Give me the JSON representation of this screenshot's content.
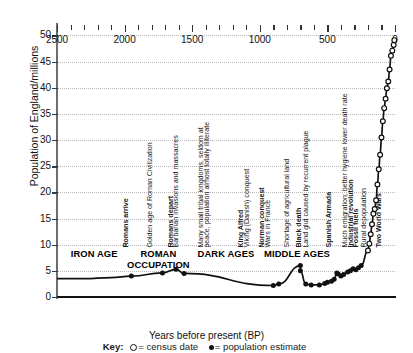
{
  "chart_data": {
    "type": "line",
    "title": "",
    "xlabel": "Years before present (BP)",
    "ylabel": "Population of England/millions",
    "xlim": [
      2500,
      0
    ],
    "ylim": [
      0,
      52
    ],
    "xticks": [
      2500,
      2000,
      1500,
      1000,
      500,
      0
    ],
    "yticks": [
      0,
      5,
      10,
      15,
      20,
      25,
      30,
      35,
      40,
      45,
      50
    ],
    "grid": "horizontal-dotted",
    "x_minor_tick_interval": 100,
    "legend_position": "below-axis",
    "series": [
      {
        "name": "population estimate",
        "marker": "filled-circle",
        "points": [
          {
            "bp": 1950,
            "pop": 4.0
          },
          {
            "bp": 1720,
            "pop": 4.6
          },
          {
            "bp": 1620,
            "pop": 5.3
          },
          {
            "bp": 1560,
            "pop": 4.5
          },
          {
            "bp": 900,
            "pop": 2.2
          },
          {
            "bp": 860,
            "pop": 2.5
          },
          {
            "bp": 700,
            "pop": 6.0
          },
          {
            "bp": 700,
            "pop": 5.0
          },
          {
            "bp": 660,
            "pop": 2.5
          },
          {
            "bp": 620,
            "pop": 2.3
          },
          {
            "bp": 560,
            "pop": 2.3
          },
          {
            "bp": 520,
            "pop": 2.6
          },
          {
            "bp": 500,
            "pop": 2.8
          },
          {
            "bp": 470,
            "pop": 3.0
          },
          {
            "bp": 450,
            "pop": 3.4
          },
          {
            "bp": 430,
            "pop": 4.6
          },
          {
            "bp": 420,
            "pop": 4.4
          },
          {
            "bp": 400,
            "pop": 4.0
          },
          {
            "bp": 380,
            "pop": 4.3
          },
          {
            "bp": 350,
            "pop": 4.8
          },
          {
            "bp": 330,
            "pop": 5.0
          },
          {
            "bp": 310,
            "pop": 5.4
          },
          {
            "bp": 290,
            "pop": 5.2
          },
          {
            "bp": 270,
            "pop": 5.6
          },
          {
            "bp": 250,
            "pop": 6.0
          }
        ]
      },
      {
        "name": "census date",
        "marker": "open-circle",
        "points": [
          {
            "bp": 200,
            "pop": 8.9
          },
          {
            "bp": 190,
            "pop": 10.2
          },
          {
            "bp": 180,
            "pop": 12.0
          },
          {
            "bp": 170,
            "pop": 13.9
          },
          {
            "bp": 160,
            "pop": 15.9
          },
          {
            "bp": 150,
            "pop": 16.8
          },
          {
            "bp": 140,
            "pop": 18.5
          },
          {
            "bp": 130,
            "pop": 21.5
          },
          {
            "bp": 120,
            "pop": 24.4
          },
          {
            "bp": 110,
            "pop": 27.2
          },
          {
            "bp": 100,
            "pop": 30.5
          },
          {
            "bp": 90,
            "pop": 33.6
          },
          {
            "bp": 80,
            "pop": 36.1
          },
          {
            "bp": 70,
            "pop": 37.9
          },
          {
            "bp": 60,
            "pop": 39.9
          },
          {
            "bp": 50,
            "pop": 41.2
          },
          {
            "bp": 40,
            "pop": 43.5
          },
          {
            "bp": 30,
            "pop": 46.1
          },
          {
            "bp": 20,
            "pop": 47.1
          },
          {
            "bp": 10,
            "pop": 48.2
          },
          {
            "bp": 5,
            "pop": 49.1
          }
        ]
      }
    ],
    "eras": [
      {
        "label": "IRON AGE",
        "bp_start": 2500,
        "bp_end": 1950,
        "lines": [
          "IRON AGE"
        ]
      },
      {
        "label": "ROMAN OCCUPATION",
        "bp_start": 1950,
        "bp_end": 1550,
        "lines": [
          "ROMAN",
          "OCCUPATION"
        ]
      },
      {
        "label": "DARK AGES",
        "bp_start": 1550,
        "bp_end": 950,
        "lines": [
          "DARK AGES"
        ]
      },
      {
        "label": "MIDDLE AGES",
        "bp_start": 950,
        "bp_end": 500,
        "lines": [
          "MIDDLE AGES"
        ]
      }
    ],
    "annotations": [
      {
        "text": "Romans arrive",
        "bp": 1955,
        "bold": true
      },
      {
        "text": "Golden age of Roman Civilization",
        "bp": 1775,
        "bold": false
      },
      {
        "text": "Romans depart",
        "bp": 1620,
        "bold": true
      },
      {
        "text": "Barbarian invasions and massacres",
        "bp": 1580,
        "bold": false
      },
      {
        "text": "Many small tribal kingdoms, seldom at",
        "bp": 1395,
        "bold": false
      },
      {
        "text": "peace, population almost totally illiterate",
        "bp": 1350,
        "bold": false
      },
      {
        "text": "King Alfred",
        "bp": 1105,
        "bold": true
      },
      {
        "text": "Viking (Danish) conquest",
        "bp": 1060,
        "bold": false
      },
      {
        "text": "Norman conquest",
        "bp": 945,
        "bold": true
      },
      {
        "text": "Wars in France",
        "bp": 900,
        "bold": false
      },
      {
        "text": "Shortage of agricultural land",
        "bp": 760,
        "bold": false
      },
      {
        "text": "Black death",
        "bp": 670,
        "bold": true
      },
      {
        "text": "Land glut caused by recurrent plague",
        "bp": 620,
        "bold": false
      },
      {
        "text": "Spanish Armada",
        "bp": 450,
        "bold": true
      },
      {
        "text": "Much emigration; better hygiene lower death rate",
        "bp": 330,
        "bold": false
      },
      {
        "text": "Industrial revolution",
        "bp": 290,
        "bold": true
      },
      {
        "text": "Fossil fuels",
        "bp": 250,
        "bold": true
      },
      {
        "text": "Rural depopulation",
        "bp": 195,
        "bold": false
      },
      {
        "text": "Two World Wars",
        "bp": 85,
        "bold": true
      }
    ]
  },
  "key": {
    "label": "Key:",
    "census_text": "= census date",
    "estimate_text": "= population estimate"
  }
}
